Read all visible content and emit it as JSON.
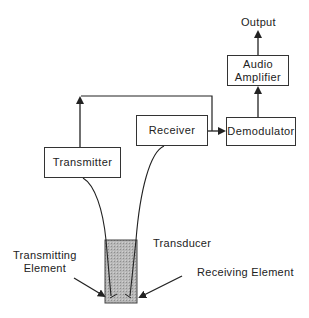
{
  "diagram": {
    "blocks": {
      "transmitter": "Transmitter",
      "receiver": "Receiver",
      "demodulator": "Demodulator",
      "audio_amplifier_line1": "Audio",
      "audio_amplifier_line2": "Amplifier"
    },
    "labels": {
      "output": "Output",
      "transducer": "Transducer",
      "transmitting_element_line1": "Transmitting",
      "transmitting_element_line2": "Element",
      "receiving_element": "Receiving Element"
    },
    "colors": {
      "line": "#222222",
      "transducer_fill": "#b5b5b5"
    }
  }
}
